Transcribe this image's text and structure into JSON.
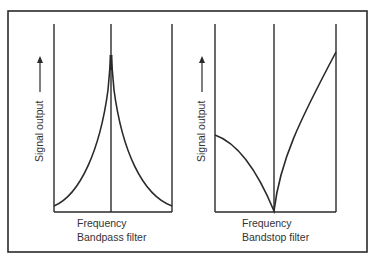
{
  "figure": {
    "panels": [
      {
        "ylabel": "Signal output",
        "xlabel": "Frequency",
        "caption": "Bandpass filter"
      },
      {
        "ylabel": "Signal output",
        "xlabel": "Frequency",
        "caption": "Bandstop filter"
      }
    ],
    "colors": {
      "line": "#2a2a2a",
      "background": "#ffffff"
    }
  }
}
